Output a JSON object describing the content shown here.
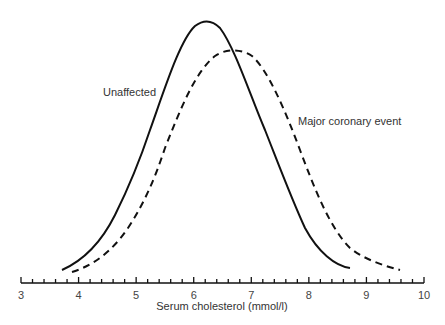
{
  "chart_data": {
    "type": "line",
    "title": "",
    "xlabel": "Serum cholesterol (mmol/l)",
    "ylabel": "",
    "xlim": [
      3,
      10
    ],
    "x_ticks": [
      "3",
      "4",
      "5",
      "6",
      "7",
      "8",
      "9",
      "10"
    ],
    "minor_tick_step": 0.2,
    "grid": false,
    "legend": "inline labels",
    "series": [
      {
        "name": "Unaffected",
        "style": "solid",
        "color": "#111111",
        "x": [
          3.7,
          4.0,
          4.5,
          5.0,
          5.5,
          6.0,
          6.2,
          6.5,
          7.0,
          7.5,
          8.0,
          8.5,
          8.75
        ],
        "y_rel": [
          0.02,
          0.07,
          0.22,
          0.45,
          0.75,
          0.97,
          1.0,
          0.94,
          0.62,
          0.32,
          0.12,
          0.03,
          0.01
        ]
      },
      {
        "name": "Major coronary event",
        "style": "dashed",
        "color": "#111111",
        "x": [
          3.9,
          4.5,
          5.0,
          5.5,
          6.0,
          6.5,
          6.7,
          7.0,
          7.5,
          8.0,
          8.5,
          9.0,
          9.5,
          9.7
        ],
        "y_rel": [
          0.01,
          0.08,
          0.22,
          0.45,
          0.72,
          0.88,
          0.89,
          0.85,
          0.67,
          0.42,
          0.2,
          0.07,
          0.02,
          0.0
        ]
      }
    ]
  },
  "labels": {
    "unaffected": "Unaffected",
    "coronary": "Major coronary event",
    "xlabel": "Serum cholesterol (mmol/l)",
    "ticks": [
      "3",
      "4",
      "5",
      "6",
      "7",
      "8",
      "9",
      "10"
    ]
  }
}
